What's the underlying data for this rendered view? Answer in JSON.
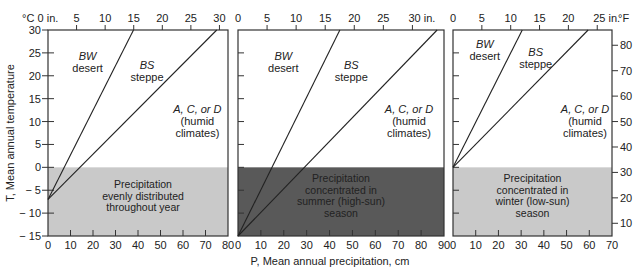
{
  "chart_data": [
    {
      "type": "line",
      "title": "Precipitation evenly distributed throughout year",
      "xlabel": "P, Mean annual precipitation, cm",
      "ylabel": "T, Mean annual temperature",
      "xlim_cm": [
        0,
        80
      ],
      "xlim_in_ticks": [
        "0 in.",
        "5",
        "10",
        "15",
        "20",
        "25",
        "30"
      ],
      "x_ticks_cm": [
        0,
        10,
        20,
        30,
        40,
        50,
        60,
        70,
        80
      ],
      "ylim_c": [
        -15,
        30
      ],
      "y_ticks_c": [
        30,
        25,
        20,
        15,
        10,
        5,
        0,
        -5,
        -10,
        -15
      ],
      "shaded_region": {
        "from_c": -15,
        "to_c": 0,
        "color": "#c8c8c8"
      },
      "series": [
        {
          "name": "BW/BS boundary",
          "points": [
            [
              0,
              -7
            ],
            [
              38,
              30
            ]
          ]
        },
        {
          "name": "BS/humid boundary",
          "points": [
            [
              0,
              -7
            ],
            [
              75,
              30
            ]
          ]
        }
      ],
      "region_labels": [
        {
          "italic": "BW",
          "text": "desert"
        },
        {
          "italic": "BS",
          "text": "steppe"
        },
        {
          "italic": "A, C, or D",
          "text": "(humid climates)"
        }
      ]
    },
    {
      "type": "line",
      "title": "Precipitation concentrated in summer (high-sun) season",
      "xlim_cm": [
        0,
        90
      ],
      "xlim_in_ticks": [
        "0",
        "5",
        "10",
        "15",
        "20",
        "25",
        "30 in."
      ],
      "x_ticks_cm": [
        0,
        10,
        20,
        30,
        40,
        50,
        60,
        70,
        80,
        90
      ],
      "ylim_c": [
        -15,
        30
      ],
      "shaded_region": {
        "from_c": -15,
        "to_c": 0,
        "color": "#5a5a5a"
      },
      "series": [
        {
          "name": "BW/BS boundary",
          "points": [
            [
              0,
              -15
            ],
            [
              44.5,
              30
            ]
          ]
        },
        {
          "name": "BS/humid boundary",
          "points": [
            [
              0,
              -15
            ],
            [
              87,
              30
            ]
          ]
        }
      ],
      "region_labels": [
        {
          "italic": "BW",
          "text": "desert"
        },
        {
          "italic": "BS",
          "text": "steppe"
        },
        {
          "italic": "A, C, or D",
          "text": "(humid climates)"
        }
      ]
    },
    {
      "type": "line",
      "title": "Precipitation concentrated in winter (low-sun) season",
      "xlim_cm": [
        0,
        70
      ],
      "xlim_in_ticks": [
        "0",
        "5",
        "10",
        "15",
        "20",
        "25 in."
      ],
      "x_ticks_cm": [
        0,
        10,
        20,
        30,
        40,
        50,
        60,
        70
      ],
      "ylim_f": [
        5,
        86
      ],
      "y_ticks_f": [
        80,
        70,
        60,
        50,
        40,
        30,
        20,
        10
      ],
      "y_unit_right": "°F",
      "shaded_region": {
        "from_c": -15,
        "to_c": 0,
        "color": "#cbcbcb"
      },
      "series": [
        {
          "name": "BW/BS boundary",
          "points": [
            [
              0,
              0
            ],
            [
              30.5,
              30
            ]
          ]
        },
        {
          "name": "BS/humid boundary",
          "points": [
            [
              0,
              0
            ],
            [
              59.5,
              30
            ]
          ]
        }
      ],
      "region_labels": [
        {
          "italic": "BW",
          "text": "desert"
        },
        {
          "italic": "BS",
          "text": "steppe"
        },
        {
          "italic": "A, C, or D",
          "text": "(humid climates)"
        }
      ]
    }
  ],
  "labels": {
    "unit_c": "°C",
    "unit_f": "°F",
    "ylabel": "T, Mean annual temperature",
    "xlabel": "P, Mean annual precipitation, cm",
    "bw": "BW",
    "desert": "desert",
    "bs": "BS",
    "steppe": "steppe",
    "acd": "A, C, or D",
    "humid1": "(humid",
    "humid2": "climates)",
    "p1": [
      "Precipitation",
      "evenly distributed",
      "throughout year"
    ],
    "p2": [
      "Precipitation",
      "concentrated in",
      "summer (high-sun)",
      "season"
    ],
    "p3": [
      "Precipitation",
      "concentrated in",
      "winter (low-sun)",
      "season"
    ]
  },
  "colors": {
    "frame": "#333333",
    "shade_light": "#c9c9c9",
    "shade_dark": "#595959"
  }
}
